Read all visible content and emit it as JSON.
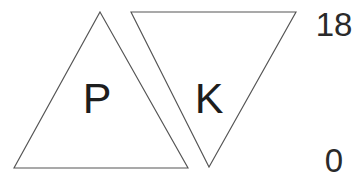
{
  "figure": {
    "name": "two-overlapping-triangles-with-scale",
    "background_color": "#ffffff",
    "width": 362,
    "height": 181,
    "stroke_color": "#555555",
    "text_color": "#1d1d1d"
  },
  "shapes": [
    {
      "id": "triangle-p",
      "label": "P",
      "orientation": "upright",
      "points": "100,12 188,168 14,168",
      "label_x": 97,
      "label_y": 113
    },
    {
      "id": "triangle-k",
      "label": "K",
      "orientation": "inverted",
      "points": "131,12 296,12 209,167",
      "label_x": 209,
      "label_y": 113
    }
  ],
  "scale": {
    "top_label": "18",
    "bottom_label": "0",
    "top_x": 334,
    "top_y": 36,
    "bottom_x": 334,
    "bottom_y": 172
  }
}
